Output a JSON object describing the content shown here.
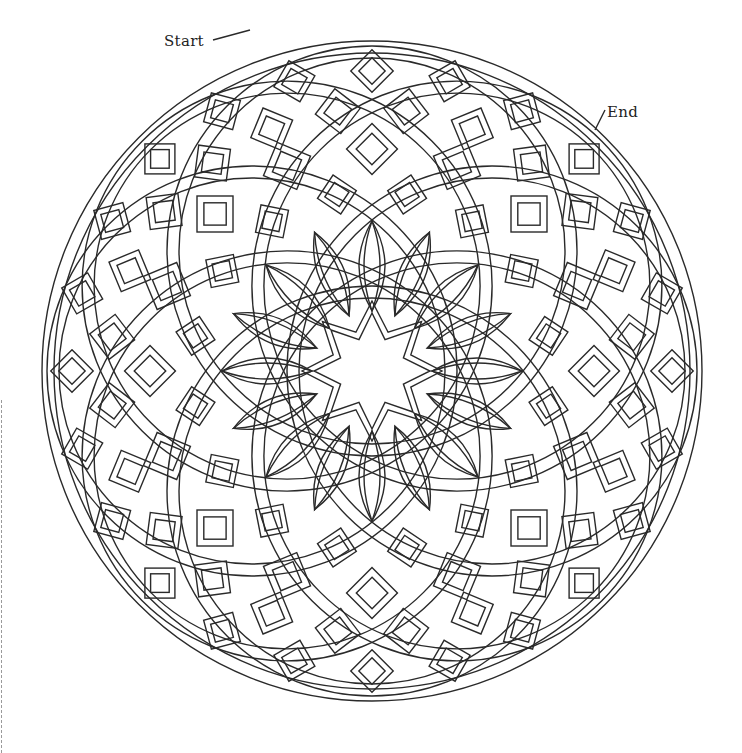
{
  "page": {
    "type": "coloring-page",
    "background": "#ffffff",
    "line_color": "#2a2a2a"
  },
  "labels": {
    "start": "Start",
    "end": "End"
  },
  "mandala": {
    "center": [
      372,
      371
    ],
    "outer_radius": 330,
    "ring_circle_count": 8,
    "ring_circle_offset": 120,
    "ring_circle_radius": 205,
    "band_width": 12,
    "center_star_points": 8,
    "center_star_outer": 70,
    "center_star_inner": 42
  },
  "decorations": {
    "cut_line": "dashed-left-edge"
  }
}
